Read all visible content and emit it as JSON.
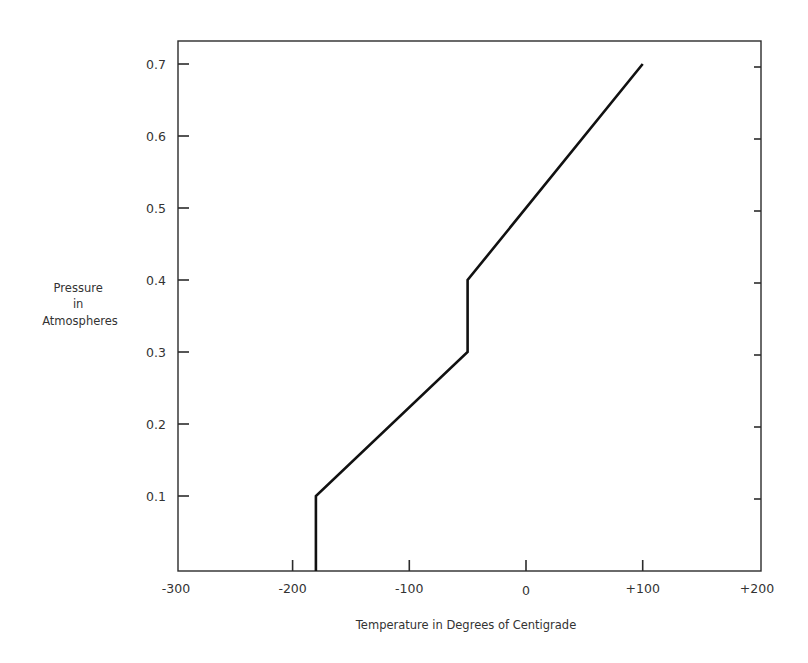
{
  "chart_data": {
    "type": "line",
    "title": "",
    "xlabel": "Temperature in Degrees of Centigrade",
    "ylabel": [
      "Pressure",
      "in",
      "Atmospheres"
    ],
    "xlim": [
      -300,
      200
    ],
    "ylim": [
      0,
      0.75
    ],
    "grid": false,
    "legend": null,
    "x_ticks": [
      {
        "value": -300,
        "label": "-300"
      },
      {
        "value": -200,
        "label": "-200"
      },
      {
        "value": -100,
        "label": "-100"
      },
      {
        "value": 0,
        "label": "0"
      },
      {
        "value": 100,
        "label": "+100"
      },
      {
        "value": 200,
        "label": "+200"
      }
    ],
    "y_ticks": [
      {
        "value": 0.1,
        "label": "0.1"
      },
      {
        "value": 0.2,
        "label": "0.2"
      },
      {
        "value": 0.3,
        "label": "0.3"
      },
      {
        "value": 0.4,
        "label": "0.4"
      },
      {
        "value": 0.5,
        "label": "0.5"
      },
      {
        "value": 0.6,
        "label": "0.6"
      },
      {
        "value": 0.7,
        "label": "0.7"
      }
    ],
    "series": [
      {
        "name": "Temperature profile",
        "x": [
          -180,
          -180,
          -50,
          -50,
          100
        ],
        "y": [
          0,
          0.1,
          0.3,
          0.4,
          0.7
        ]
      }
    ]
  }
}
